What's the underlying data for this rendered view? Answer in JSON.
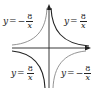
{
  "figure": {
    "axes": {
      "x_arrow": true,
      "y_arrow": true,
      "color": "#222222"
    },
    "curves": [
      {
        "quadrant": "top-left",
        "equation": "y = -8/x",
        "color": "#888888"
      },
      {
        "quadrant": "top-right",
        "equation": "y = 8/x",
        "color": "#222222"
      },
      {
        "quadrant": "bottom-left",
        "equation": "y = 8/x",
        "color": "#222222"
      },
      {
        "quadrant": "bottom-right",
        "equation": "y = -8/x",
        "color": "#888888"
      }
    ],
    "labels": {
      "top_left": {
        "lhs": "y",
        "eq": "=",
        "sign": "−",
        "num": "8",
        "den": "x"
      },
      "top_right": {
        "lhs": "y",
        "eq": "=",
        "sign": "",
        "num": "8",
        "den": "x"
      },
      "bottom_left": {
        "lhs": "y",
        "eq": "=",
        "sign": "",
        "num": "8",
        "den": "x"
      },
      "bottom_right": {
        "lhs": "y",
        "eq": "=",
        "sign": "−",
        "num": "8",
        "den": "x"
      }
    }
  }
}
